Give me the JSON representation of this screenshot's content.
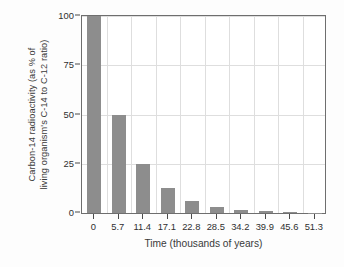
{
  "chart_data": {
    "type": "bar",
    "title": "",
    "xlabel": "Time (thousands of years)",
    "ylabel": "Carbon-14 radioactivity (as % of living organism's C-14 to C-12 ratio)",
    "ylabel_line1": "Carbon-14 radioactivity (as % of",
    "ylabel_line2": "living organism's C-14 to C-12 ratio)",
    "categories": [
      "0",
      "5.7",
      "11.4",
      "17.1",
      "22.8",
      "28.5",
      "34.2",
      "39.9",
      "45.6",
      "51.3"
    ],
    "values": [
      100,
      50,
      25,
      12.5,
      6.25,
      3.125,
      1.5625,
      0.78,
      0.39,
      0.195
    ],
    "ylim": [
      0,
      100
    ],
    "yticks": [
      "0",
      "25",
      "50",
      "75",
      "100"
    ],
    "ytick_values": [
      0,
      25,
      50,
      75,
      100
    ],
    "xlim": [
      0,
      51.3
    ],
    "grid": "both",
    "legend": "none",
    "bar_color": "#8d8d8d",
    "grid_color": "#dedede",
    "frame_color": "#6e6e6e",
    "background": "#ffffff"
  }
}
